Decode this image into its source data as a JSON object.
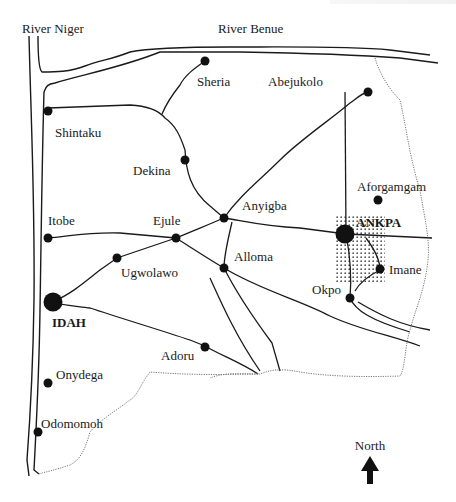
{
  "map": {
    "rivers": [
      {
        "name": "River Niger",
        "label": "River Niger"
      },
      {
        "name": "River Benue",
        "label": "River Benue"
      }
    ],
    "towns": [
      {
        "name": "Sheria",
        "label": "Sheria",
        "size": "small"
      },
      {
        "name": "Abejukolo",
        "label": "Abejukolo",
        "size": "small"
      },
      {
        "name": "Shintaku",
        "label": "Shintaku",
        "size": "small"
      },
      {
        "name": "Dekina",
        "label": "Dekina",
        "size": "small"
      },
      {
        "name": "Aforgamgam",
        "label": "Aforgamgam",
        "size": "small"
      },
      {
        "name": "Anyigba",
        "label": "Anyigba",
        "size": "small"
      },
      {
        "name": "Itobe",
        "label": "Itobe",
        "size": "small"
      },
      {
        "name": "Ejule",
        "label": "Ejule",
        "size": "small"
      },
      {
        "name": "ANKPA",
        "label": "ANKPA",
        "size": "large"
      },
      {
        "name": "Ugwolawo",
        "label": "Ugwolawo",
        "size": "small"
      },
      {
        "name": "Alloma",
        "label": "Alloma",
        "size": "small"
      },
      {
        "name": "Imane",
        "label": "Imane",
        "size": "small"
      },
      {
        "name": "Okpo",
        "label": "Okpo",
        "size": "small"
      },
      {
        "name": "IDAH",
        "label": "IDAH",
        "size": "large"
      },
      {
        "name": "Adoru",
        "label": "Adoru",
        "size": "small"
      },
      {
        "name": "Onydega",
        "label": "Onydega",
        "size": "small"
      },
      {
        "name": "Odomomoh",
        "label": "Odomomoh",
        "size": "small"
      }
    ],
    "compass": {
      "label": "North",
      "icon": "north-arrow-icon"
    },
    "highlight_area": "ANKPA (stippled)",
    "colors": {
      "ink": "#1a1a1a",
      "boundary": "#777777",
      "background": "#ffffff"
    }
  }
}
